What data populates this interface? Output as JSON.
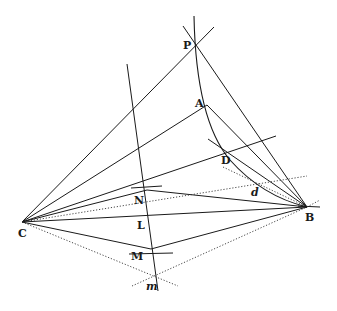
{
  "diagram": {
    "type": "geometric-construction",
    "background": "#ffffff",
    "ink_color": "#1a1a1a",
    "points": [
      {
        "id": "P",
        "label": "P",
        "x": 197,
        "y": 44,
        "lx": 183,
        "ly": 49,
        "style": "bold"
      },
      {
        "id": "A",
        "label": "A",
        "x": 207,
        "y": 105,
        "lx": 195,
        "ly": 107,
        "style": "bold"
      },
      {
        "id": "D",
        "label": "D",
        "x": 227,
        "y": 152,
        "lx": 221,
        "ly": 164,
        "style": "bold"
      },
      {
        "id": "d",
        "label": "d",
        "x": 254,
        "y": 192,
        "lx": 251,
        "ly": 196,
        "style": "italic"
      },
      {
        "id": "B",
        "label": "B",
        "x": 307,
        "y": 207,
        "lx": 305,
        "ly": 221,
        "style": "bold"
      },
      {
        "id": "C",
        "label": "C",
        "x": 22,
        "y": 222,
        "lx": 18,
        "ly": 237,
        "style": "bold"
      },
      {
        "id": "N",
        "label": "N",
        "x": 147,
        "y": 190,
        "lx": 134,
        "ly": 204,
        "style": "bold"
      },
      {
        "id": "L",
        "label": "L",
        "x": 143,
        "y": 224,
        "lx": 137,
        "ly": 229,
        "style": "bold"
      },
      {
        "id": "M",
        "label": "M",
        "x": 151,
        "y": 249,
        "lx": 131,
        "ly": 260,
        "style": "bold"
      },
      {
        "id": "m",
        "label": "m",
        "x": 155,
        "y": 276,
        "lx": 146,
        "ly": 290,
        "style": "italic"
      }
    ],
    "solid_lines": [
      {
        "name": "line-C-P",
        "x1": 22,
        "y1": 222,
        "x2": 214,
        "y2": 27
      },
      {
        "name": "line-C-A",
        "x1": 22,
        "y1": 222,
        "x2": 207,
        "y2": 105
      },
      {
        "name": "line-C-D-extended",
        "x1": 22,
        "y1": 222,
        "x2": 276,
        "y2": 136
      },
      {
        "name": "line-C-N",
        "x1": 22,
        "y1": 222,
        "x2": 147,
        "y2": 190
      },
      {
        "name": "line-C-B",
        "x1": 22,
        "y1": 222,
        "x2": 307,
        "y2": 207
      },
      {
        "name": "line-C-M",
        "x1": 22,
        "y1": 222,
        "x2": 151,
        "y2": 249
      },
      {
        "name": "line-P-B",
        "x1": 183,
        "y1": 26,
        "x2": 307,
        "y2": 207
      },
      {
        "name": "line-A-B",
        "x1": 207,
        "y1": 105,
        "x2": 307,
        "y2": 207
      },
      {
        "name": "line-D-B",
        "x1": 208,
        "y1": 139,
        "x2": 307,
        "y2": 207
      },
      {
        "name": "line-N-B",
        "x1": 147,
        "y1": 190,
        "x2": 307,
        "y2": 207
      },
      {
        "name": "line-M-B",
        "x1": 151,
        "y1": 249,
        "x2": 307,
        "y2": 207
      },
      {
        "name": "perpendicular-bisector",
        "x1": 127,
        "y1": 64,
        "x2": 158,
        "y2": 291
      },
      {
        "name": "tick-N",
        "x1": 131,
        "y1": 188,
        "x2": 162,
        "y2": 186
      },
      {
        "name": "tick-M",
        "x1": 129,
        "y1": 254,
        "x2": 173,
        "y2": 253
      },
      {
        "name": "tick-B",
        "x1": 298,
        "y1": 206,
        "x2": 320,
        "y2": 207
      }
    ],
    "dotted_lines": [
      {
        "name": "dotted-C-d",
        "x1": 22,
        "y1": 222,
        "x2": 307,
        "y2": 176
      },
      {
        "name": "dotted-C-m",
        "x1": 22,
        "y1": 222,
        "x2": 178,
        "y2": 286
      },
      {
        "name": "dotted-m-B",
        "x1": 132,
        "y1": 286,
        "x2": 307,
        "y2": 207
      },
      {
        "name": "dotted-D-B",
        "x1": 223,
        "y1": 167,
        "x2": 307,
        "y2": 207
      },
      {
        "name": "dotted-B-extension",
        "x1": 307,
        "y1": 207,
        "x2": 320,
        "y2": 200
      }
    ],
    "arcs": [
      {
        "name": "arc-through-P-A-D-B",
        "path": "M 194 16 Q 196 120 230 160 Q 262 196 307 207"
      }
    ]
  }
}
